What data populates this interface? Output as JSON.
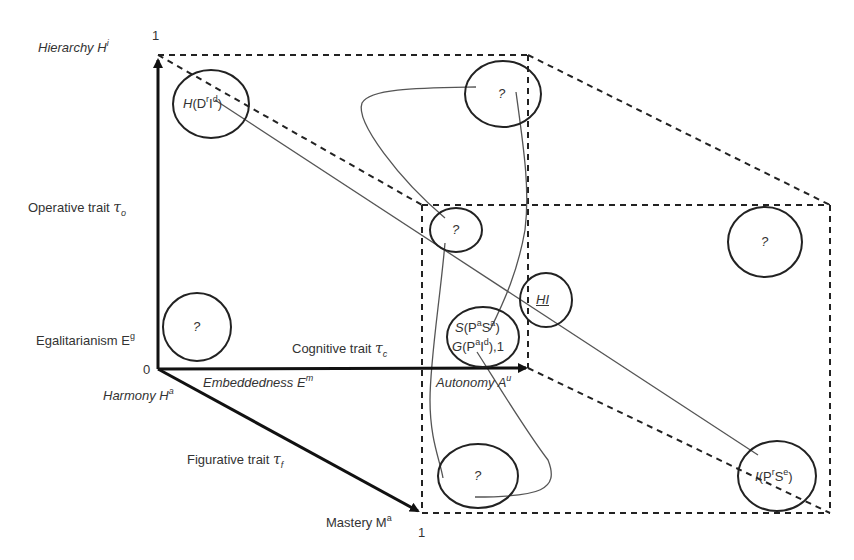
{
  "diagram": {
    "axes": {
      "origin_label": "0",
      "vertical": {
        "top_tick": "1",
        "top_label_name": "Hierarchy H",
        "top_label_sup": "i",
        "trait_label": "Operative trait",
        "trait_symbol": "τ",
        "trait_sub": "o",
        "bottom_label_name": "Egalitarianism E",
        "bottom_label_sup": "g"
      },
      "horizontal": {
        "trait_label": "Cognitive trait",
        "trait_symbol": "τ",
        "trait_sub": "c",
        "left_label_name": "Embeddedness E",
        "left_label_sup": "m",
        "right_label_name": "Autonomy A",
        "right_label_sup": "u"
      },
      "diagonal": {
        "start_label_name": "Harmony H",
        "start_label_sup": "a",
        "trait_label": "Figurative trait",
        "trait_symbol": "τ",
        "trait_sub": "f",
        "end_label_name": "Mastery M",
        "end_label_sup": "a",
        "end_tick": "1"
      }
    },
    "nodes": [
      {
        "id": "hierarchy-node",
        "main": "H",
        "text": "(D",
        "sup1": "r",
        "mid": "I",
        "sup2": "d",
        "close": ")"
      },
      {
        "id": "top-unknown-node",
        "text": "?"
      },
      {
        "id": "operative-unknown-node",
        "text": "?"
      },
      {
        "id": "right-unknown-node",
        "text": "?"
      },
      {
        "id": "egalitarian-unknown-node",
        "text": "?"
      },
      {
        "id": "hi-node",
        "text": "HI"
      },
      {
        "id": "sg-node",
        "line1_main": "S",
        "line1_open": "(P",
        "line1_sup1": "a",
        "line1_mid": "S",
        "line1_sup2": "a",
        "line1_close": ")",
        "line2_main": "G",
        "line2_open": "(P",
        "line2_sup1": "a",
        "line2_mid": "I",
        "line2_sup2": "d",
        "line2_close": "),1"
      },
      {
        "id": "bottom-unknown-node",
        "text": "?"
      },
      {
        "id": "individual-node",
        "main": "I",
        "text": "(P",
        "sup1": "r",
        "mid": "S",
        "sup2": "e",
        "close": ")"
      }
    ],
    "colors": {
      "axis": "#111111",
      "node_outline": "#222222",
      "dashed": "#222222",
      "curve": "#555555",
      "text": "#333333"
    }
  }
}
